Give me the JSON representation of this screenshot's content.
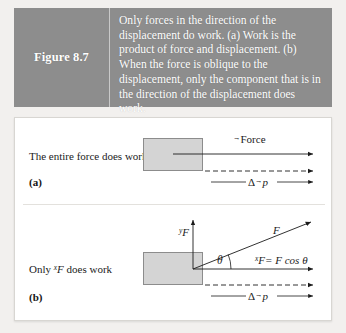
{
  "figure": {
    "label": "Figure 8.7",
    "caption": "Only forces in the direction of the displacement do work. (a) Work is the product of force and displacement. (b) When the force is oblique to the displacement, only the component that is in the direction of the displacement does work.",
    "band_color": "#8d8d8d",
    "band_text_color": "#ffffff"
  },
  "panel_a": {
    "letter": "(a)",
    "description": "The entire force does work",
    "force_label": "Force",
    "force_label_vector_mark": "→",
    "momentum_label_delta": "Δ",
    "momentum_label_symbol": "p",
    "momentum_label_vector_mark": "→",
    "box_fill": "#d4d4d4",
    "box_stroke": "#8c8c8c"
  },
  "panel_b": {
    "letter": "(b)",
    "description_prefix": "Only ",
    "description_symbol": "F",
    "description_superscript": "x",
    "description_suffix": " does work",
    "vertical_component_symbol": "F",
    "vertical_component_superscript": "y",
    "oblique_force_symbol": "F",
    "angle_symbol": "θ",
    "component_equation_lhs_superscript": "x",
    "component_equation_lhs_symbol": "F",
    "component_equation_rhs": "= F cos θ",
    "momentum_label_delta": "Δ",
    "momentum_label_symbol": "p",
    "momentum_label_vector_mark": "→",
    "box_fill": "#d4d4d4",
    "box_stroke": "#8c8c8c"
  },
  "colors": {
    "page_background": "#f2f0ee",
    "panel_background": "#ffffff",
    "ink": "#1b1b1b",
    "panel_border": "#d8d6d2"
  }
}
